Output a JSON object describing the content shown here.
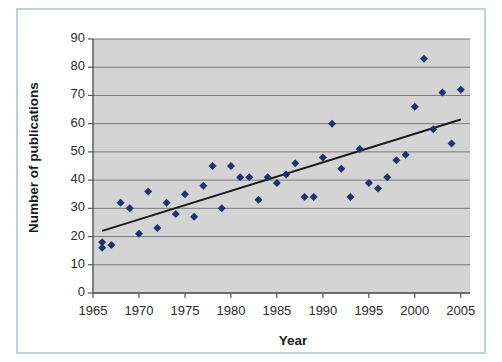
{
  "chart_data": {
    "type": "scatter",
    "title": "",
    "xlabel": "Year",
    "ylabel": "Number of publications",
    "xlim": [
      1965,
      2006
    ],
    "ylim": [
      0,
      90
    ],
    "xticks": [
      1965,
      1970,
      1975,
      1980,
      1985,
      1990,
      1995,
      2000,
      2005
    ],
    "yticks": [
      0,
      10,
      20,
      30,
      40,
      50,
      60,
      70,
      80,
      90
    ],
    "grid": "horizontal",
    "legend": "none",
    "plot_background": "#d4d4d4",
    "marker_color": "#1f3172",
    "marker_shape": "diamond",
    "trendline": {
      "type": "linear",
      "color": "#1a1a1a",
      "x_start": 1966,
      "y_start": 22,
      "x_end": 2005,
      "y_end": 61.5
    },
    "series": [
      {
        "name": "Publications",
        "points": [
          {
            "x": 1966,
            "y": 18
          },
          {
            "x": 1966,
            "y": 16
          },
          {
            "x": 1967,
            "y": 17
          },
          {
            "x": 1968,
            "y": 32
          },
          {
            "x": 1969,
            "y": 30
          },
          {
            "x": 1970,
            "y": 21
          },
          {
            "x": 1971,
            "y": 36
          },
          {
            "x": 1972,
            "y": 23
          },
          {
            "x": 1973,
            "y": 32
          },
          {
            "x": 1974,
            "y": 28
          },
          {
            "x": 1975,
            "y": 35
          },
          {
            "x": 1976,
            "y": 27
          },
          {
            "x": 1977,
            "y": 38
          },
          {
            "x": 1978,
            "y": 45
          },
          {
            "x": 1979,
            "y": 30
          },
          {
            "x": 1980,
            "y": 45
          },
          {
            "x": 1981,
            "y": 41
          },
          {
            "x": 1982,
            "y": 41
          },
          {
            "x": 1983,
            "y": 33
          },
          {
            "x": 1984,
            "y": 41
          },
          {
            "x": 1985,
            "y": 39
          },
          {
            "x": 1986,
            "y": 42
          },
          {
            "x": 1987,
            "y": 46
          },
          {
            "x": 1988,
            "y": 34
          },
          {
            "x": 1989,
            "y": 34
          },
          {
            "x": 1990,
            "y": 48
          },
          {
            "x": 1991,
            "y": 60
          },
          {
            "x": 1992,
            "y": 44
          },
          {
            "x": 1993,
            "y": 34
          },
          {
            "x": 1994,
            "y": 51
          },
          {
            "x": 1995,
            "y": 39
          },
          {
            "x": 1996,
            "y": 37
          },
          {
            "x": 1997,
            "y": 41
          },
          {
            "x": 1998,
            "y": 47
          },
          {
            "x": 1999,
            "y": 49
          },
          {
            "x": 2000,
            "y": 66
          },
          {
            "x": 2001,
            "y": 83
          },
          {
            "x": 2002,
            "y": 58
          },
          {
            "x": 2003,
            "y": 71
          },
          {
            "x": 2004,
            "y": 53
          },
          {
            "x": 2005,
            "y": 72
          }
        ]
      }
    ]
  }
}
